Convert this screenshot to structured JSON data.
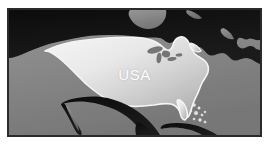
{
  "figure": {
    "kind": "reference-map",
    "title": "USA",
    "projection_region": "North America",
    "page_background": "#ffffff"
  },
  "frame": {
    "border_color": "#2b2b2b",
    "border_width_px": 2,
    "x": 7,
    "y": 8,
    "width": 255,
    "height": 129
  },
  "palette": {
    "ocean": "#8e8e8e",
    "ocean_light": "#9a9a9a",
    "ocean_dark": "#6f6f6f",
    "foreign_land": "#141414",
    "highlight_land_light": "#fbfbfb",
    "highlight_land_dark": "#b4b4b4",
    "coast_outline": "#ffffff",
    "lake": "#7d7d7d",
    "label_color": "#fdfdfd"
  },
  "labels": {
    "country": "USA"
  },
  "features": {
    "highlighted_country": "USA",
    "neighbors": [
      "Canada",
      "Mexico",
      "Cuba",
      "Bahamas"
    ],
    "waterbodies": [
      "Pacific Ocean",
      "Atlantic Ocean",
      "Gulf of Mexico",
      "Great Lakes",
      "Hudson Bay"
    ]
  },
  "geometry": {
    "canada_path": "M 0 0 L 255 0 L 255 18 L 249 17 L 243 13 L 236 14 L 231 11 L 224 12 L 218 9 L 212 12 L 205 10 L 198 13 L 191 11 L 184 14 L 176 12 L 169 15 L 161 13 L 154 16 L 147 14 L 140 17 L 132 15 L 124 18 L 116 16 L 108 19 L 100 17 L 92 20 L 84 18 L 76 21 L 68 19 L 60 22 L 52 20 L 44 23 L 36 21 L 28 24 L 20 22 L 12 25 L 6 23 L 0 26 Z",
    "canada_body": "M 0 0 L 255 0 L 255 44 L 248 46 L 243 42 L 238 45 L 233 40 L 227 43 L 222 38 L 215 41 L 210 36 L 204 40 L 199 34 L 193 37 L 188 31 L 182 35 L 177 29 L 171 33 L 166 27 L 160 31 L 154 26 L 148 30 L 142 25 L 135 29 L 129 24 L 122 28 L 116 23 L 109 27 L 103 22 L 96 26 L 90 21 L 83 25 L 77 20 L 70 24 L 64 19 L 57 23 L 51 18 L 44 22 L 38 17 L 31 21 L 25 16 L 18 20 L 12 15 L 6 19 L 0 14 Z",
    "hudson_bay": "M 118 0 L 150 0 L 156 6 L 152 14 L 143 18 L 132 16 L 124 10 L 119 4 Z",
    "usa_path": "M 36 36 L 50 31 L 66 28 L 84 26 L 104 25 L 124 25 L 142 26 L 152 30 L 158 34 L 163 33 L 167 28 L 172 24 L 178 23 L 183 27 L 186 33 L 190 38 L 196 41 L 202 43 L 208 48 L 212 55 L 211 62 L 206 69 L 200 76 L 194 83 L 189 90 L 185 97 L 183 104 L 180 110 L 175 112 L 170 108 L 166 102 L 160 98 L 152 97 L 143 98 L 134 100 L 125 101 L 116 100 L 108 98 L 100 95 L 93 91 L 86 86 L 80 80 L 74 74 L 68 68 L 62 62 L 56 56 L 50 50 L 44 44 L 39 40 Z",
    "mexico_path": "M 56 92 L 66 90 L 76 91 L 86 94 L 96 98 L 104 103 L 110 109 L 114 116 L 116 123 L 112 127 L 106 126 L 100 121 L 94 115 L 88 110 L 82 106 L 76 103 L 70 101 L 64 100 L 58 98 Z",
    "cuba_path": "M 152 128 L 166 126 L 178 127 L 188 130 L 192 134 L 186 136 L 174 135 L 162 133 L 154 131 Z",
    "bahamas_dots": [
      {
        "cx": 188,
        "cy": 104,
        "r": 1.6
      },
      {
        "cx": 193,
        "cy": 107,
        "r": 1.3
      },
      {
        "cx": 190,
        "cy": 112,
        "r": 1.8
      },
      {
        "cx": 196,
        "cy": 114,
        "r": 1.2
      },
      {
        "cx": 185,
        "cy": 110,
        "r": 1.1
      },
      {
        "cx": 194,
        "cy": 119,
        "r": 1.5
      },
      {
        "cx": 188,
        "cy": 118,
        "r": 1.0
      },
      {
        "cx": 199,
        "cy": 111,
        "r": 1.0
      }
    ],
    "great_lakes": [
      {
        "cx": 150,
        "cy": 44,
        "rx": 7,
        "ry": 3,
        "rot": -12
      },
      {
        "cx": 160,
        "cy": 47,
        "rx": 5,
        "ry": 3,
        "rot": 8
      },
      {
        "cx": 167,
        "cy": 43,
        "rx": 4,
        "ry": 2.4,
        "rot": 20
      },
      {
        "cx": 157,
        "cy": 52,
        "rx": 4.5,
        "ry": 2.2,
        "rot": -5
      }
    ]
  }
}
